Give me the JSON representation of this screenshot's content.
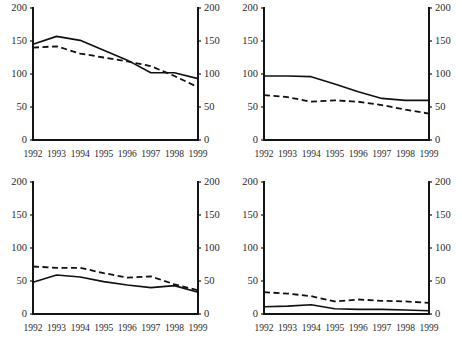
{
  "figure": {
    "cut_off_header": "",
    "background_color": "#ffffff",
    "line_color": "#101010",
    "panel_count": 4,
    "layout": "2x2 grid of small multiples"
  },
  "chart_data": [
    {
      "type": "line",
      "panel": "top-left",
      "title": "",
      "xlabel": "",
      "ylabel": "",
      "x": [
        "1992",
        "1993",
        "1994",
        "1995",
        "1996",
        "1997",
        "1998",
        "1999"
      ],
      "ylim": [
        0,
        200
      ],
      "yticks": [
        0,
        50,
        100,
        150,
        200
      ],
      "xlim": [
        "1992",
        "1999"
      ],
      "grid": false,
      "legend": "none",
      "dual_axis": true,
      "series": [
        {
          "name": "solid",
          "style": "solid",
          "values": [
            145,
            157,
            151,
            136,
            121,
            102,
            102,
            93
          ]
        },
        {
          "name": "dashed",
          "style": "dashed",
          "values": [
            140,
            142,
            131,
            125,
            119,
            112,
            97,
            80
          ]
        }
      ]
    },
    {
      "type": "line",
      "panel": "top-right",
      "title": "",
      "xlabel": "",
      "ylabel": "",
      "x": [
        "1992",
        "1993",
        "1994",
        "1995",
        "1996",
        "1997",
        "1998",
        "1999"
      ],
      "ylim": [
        0,
        200
      ],
      "yticks": [
        0,
        50,
        100,
        150,
        200
      ],
      "xlim": [
        "1992",
        "1999"
      ],
      "grid": false,
      "legend": "none",
      "dual_axis": true,
      "series": [
        {
          "name": "solid",
          "style": "solid",
          "values": [
            97,
            97,
            96,
            85,
            73,
            63,
            60,
            60
          ]
        },
        {
          "name": "dashed",
          "style": "dashed",
          "values": [
            68,
            65,
            58,
            60,
            58,
            53,
            46,
            40
          ]
        }
      ]
    },
    {
      "type": "line",
      "panel": "bottom-left",
      "title": "",
      "xlabel": "",
      "ylabel": "",
      "x": [
        "1992",
        "1993",
        "1994",
        "1995",
        "1996",
        "1997",
        "1998",
        "1999"
      ],
      "ylim": [
        0,
        200
      ],
      "yticks": [
        0,
        50,
        100,
        150,
        200
      ],
      "xlim": [
        "1992",
        "1999"
      ],
      "grid": false,
      "legend": "none",
      "dual_axis": true,
      "series": [
        {
          "name": "solid",
          "style": "solid",
          "values": [
            48,
            59,
            56,
            49,
            44,
            40,
            43,
            33
          ]
        },
        {
          "name": "dashed",
          "style": "dashed",
          "values": [
            72,
            70,
            70,
            62,
            55,
            57,
            45,
            36
          ]
        }
      ]
    },
    {
      "type": "line",
      "panel": "bottom-right",
      "title": "",
      "xlabel": "",
      "ylabel": "",
      "x": [
        "1992",
        "1993",
        "1994",
        "1995",
        "1996",
        "1997",
        "1998",
        "1999"
      ],
      "ylim": [
        0,
        200
      ],
      "yticks": [
        0,
        50,
        100,
        150,
        200
      ],
      "xlim": [
        "1992",
        "1999"
      ],
      "grid": false,
      "legend": "none",
      "dual_axis": true,
      "series": [
        {
          "name": "solid",
          "style": "solid",
          "values": [
            11,
            12,
            14,
            8,
            7,
            7,
            6,
            5
          ]
        },
        {
          "name": "dashed",
          "style": "dashed",
          "values": [
            33,
            31,
            27,
            19,
            22,
            20,
            19,
            17
          ]
        }
      ]
    }
  ]
}
